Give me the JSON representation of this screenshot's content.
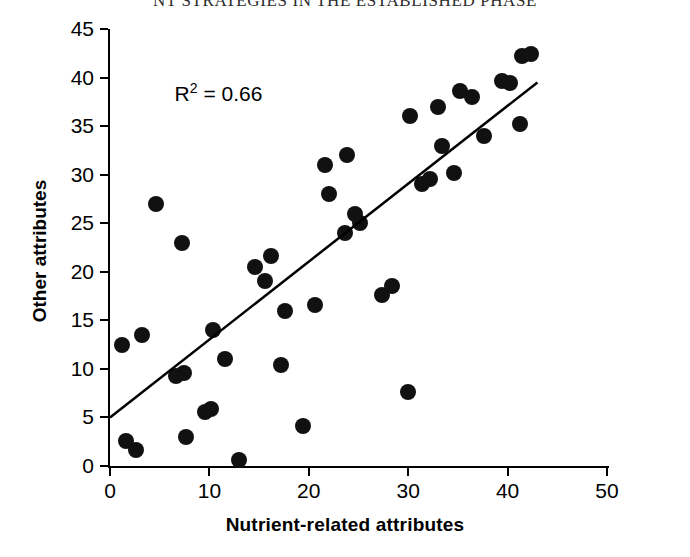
{
  "page_header": "NT STRATEGIES IN THE ESTABLISHED PHASE",
  "chart_data": {
    "type": "scatter",
    "title": "",
    "xlabel": "Nutrient-related attributes",
    "ylabel": "Other attributes",
    "xlim": [
      0,
      50
    ],
    "ylim": [
      0,
      45
    ],
    "xticks": [
      0,
      10,
      20,
      30,
      40,
      50
    ],
    "yticks": [
      0,
      5,
      10,
      15,
      20,
      25,
      30,
      35,
      40,
      45
    ],
    "xtick_labels": [
      "0",
      "10",
      "20",
      "30",
      "40",
      "50"
    ],
    "ytick_labels": [
      "0",
      "5",
      "10",
      "15",
      "20",
      "25",
      "30",
      "35",
      "40",
      "45"
    ],
    "xtick_minor_step": 5,
    "ytick_minor_step": 5,
    "grid": false,
    "legend": null,
    "marker": "filled-circle",
    "marker_color": "#111111",
    "annotations": [
      {
        "text": "R² = 0.66",
        "x": 6.5,
        "y": 38.5,
        "r_squared": 0.66
      }
    ],
    "trendline": {
      "type": "linear",
      "x_start": 0.0,
      "y_start": 5.0,
      "x_end": 43.0,
      "y_end": 39.5,
      "color": "#000000",
      "width": 2.5
    },
    "points": [
      {
        "x": 1.2,
        "y": 12.5
      },
      {
        "x": 1.6,
        "y": 2.6
      },
      {
        "x": 2.6,
        "y": 1.6
      },
      {
        "x": 3.2,
        "y": 13.5
      },
      {
        "x": 4.6,
        "y": 27.0
      },
      {
        "x": 6.6,
        "y": 9.3
      },
      {
        "x": 7.2,
        "y": 23.0
      },
      {
        "x": 7.4,
        "y": 9.6
      },
      {
        "x": 7.6,
        "y": 3.0
      },
      {
        "x": 9.6,
        "y": 5.6
      },
      {
        "x": 10.2,
        "y": 5.9
      },
      {
        "x": 10.4,
        "y": 14.0
      },
      {
        "x": 11.6,
        "y": 11.0
      },
      {
        "x": 13.0,
        "y": 0.6
      },
      {
        "x": 14.6,
        "y": 20.5
      },
      {
        "x": 15.6,
        "y": 19.0
      },
      {
        "x": 16.2,
        "y": 21.6
      },
      {
        "x": 17.2,
        "y": 10.4
      },
      {
        "x": 17.6,
        "y": 16.0
      },
      {
        "x": 19.4,
        "y": 4.1
      },
      {
        "x": 20.6,
        "y": 16.6
      },
      {
        "x": 21.6,
        "y": 31.0
      },
      {
        "x": 22.0,
        "y": 28.0
      },
      {
        "x": 23.6,
        "y": 24.0
      },
      {
        "x": 23.8,
        "y": 32.0
      },
      {
        "x": 24.6,
        "y": 26.0
      },
      {
        "x": 25.2,
        "y": 25.0
      },
      {
        "x": 27.4,
        "y": 17.6
      },
      {
        "x": 28.4,
        "y": 18.5
      },
      {
        "x": 30.0,
        "y": 7.6
      },
      {
        "x": 30.2,
        "y": 36.0
      },
      {
        "x": 31.4,
        "y": 29.0
      },
      {
        "x": 32.2,
        "y": 29.6
      },
      {
        "x": 33.0,
        "y": 37.0
      },
      {
        "x": 33.4,
        "y": 33.0
      },
      {
        "x": 34.6,
        "y": 30.2
      },
      {
        "x": 35.2,
        "y": 38.6
      },
      {
        "x": 36.4,
        "y": 38.0
      },
      {
        "x": 37.6,
        "y": 34.0
      },
      {
        "x": 39.4,
        "y": 39.6
      },
      {
        "x": 40.2,
        "y": 39.4
      },
      {
        "x": 41.2,
        "y": 35.2
      },
      {
        "x": 41.4,
        "y": 42.2
      },
      {
        "x": 42.4,
        "y": 42.4
      }
    ]
  }
}
